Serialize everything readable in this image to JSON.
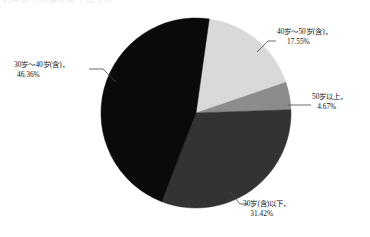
{
  "page": {
    "background_color": "#ffffff",
    "cut_off_header_text": "的年龄分布情况如下图所示"
  },
  "chart_data": {
    "type": "pie",
    "title": "",
    "labels": [
      "40岁～50岁(含)",
      "50岁以上",
      "30岁(含)以下",
      "30岁～40岁(含)"
    ],
    "values": [
      17.55,
      4.67,
      31.42,
      46.36
    ],
    "value_labels": [
      "17.55%",
      "4.67%",
      "31.42%",
      "46.36%"
    ],
    "colors": [
      "#d9d9d9",
      "#8c8c8c",
      "#333333",
      "#0a0a0a"
    ],
    "legend": "none",
    "grid": false,
    "label_position": "outside-with-leader-lines",
    "start_angle_deg": 8,
    "direction": "clockwise",
    "units": "percent"
  },
  "slices": [
    {
      "name": "40岁～50岁(含)",
      "percent": "17.55%",
      "color": "#d9d9d9",
      "label_line1": "40岁～50岁(含)，",
      "label_line2": "17.55%"
    },
    {
      "name": "50岁以上",
      "percent": "4.67%",
      "color": "#8c8c8c",
      "label_line1": "50岁以上，",
      "label_line2": "4.67%"
    },
    {
      "name": "30岁(含)以下",
      "percent": "31.42%",
      "color": "#333333",
      "label_line1": "30岁(含)以下，",
      "label_line2": "31.42%"
    },
    {
      "name": "30岁～40岁(含)",
      "percent": "46.36%",
      "color": "#0a0a0a",
      "label_line1": "30岁～40岁(含)，",
      "label_line2": "46.36%"
    }
  ]
}
